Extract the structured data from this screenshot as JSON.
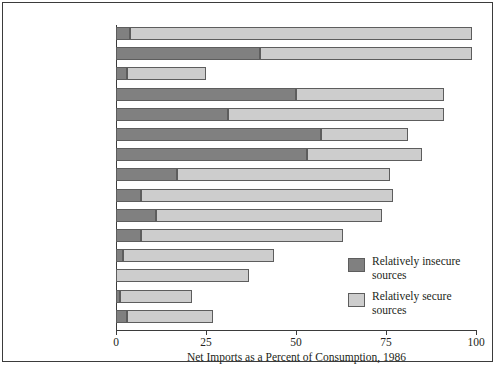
{
  "chart_data": {
    "type": "bar",
    "orientation": "horizontal",
    "stacked": true,
    "title": "",
    "xlabel": "Net Imports as a Percent of Consumption, 1986",
    "ylabel": "",
    "xlim": [
      0,
      100
    ],
    "xticks": [
      0,
      25,
      50,
      75,
      100
    ],
    "xtick_labels": [
      "0",
      "25",
      "50",
      "75",
      "100"
    ],
    "grid": false,
    "legend_position": "inside-bottom-right",
    "categories": [
      "Columbium",
      "Manganese",
      "Aluminum ores",
      "Cobalt",
      "Tantalum",
      "Chromium",
      "Platinum group",
      "Tin",
      "Nickel",
      "Zinc",
      "Tungsten",
      "Titanium (ilmenite)",
      "Iron ore",
      "Iron and steel",
      "Copper"
    ],
    "series": [
      {
        "name": "Relatively insecure sources",
        "color": "#808080",
        "values": [
          4,
          40,
          3,
          50,
          31,
          57,
          53,
          17,
          7,
          11,
          7,
          2,
          0,
          1,
          3
        ]
      },
      {
        "name": "Relatively secure sources",
        "color": "#cdcdcd",
        "values": [
          95,
          59,
          22,
          41,
          60,
          24,
          32,
          59,
          70,
          63,
          56,
          42,
          37,
          20,
          24
        ]
      }
    ],
    "totals": [
      99,
      99,
      25,
      91,
      91,
      81,
      85,
      76,
      77,
      74,
      63,
      44,
      37,
      21,
      27
    ]
  },
  "legend": {
    "items": [
      {
        "label_line1": "Relatively insecure",
        "label_line2": "sources",
        "swatch": "insecure"
      },
      {
        "label_line1": "Relatively secure",
        "label_line2": "sources",
        "swatch": "secure"
      }
    ]
  }
}
